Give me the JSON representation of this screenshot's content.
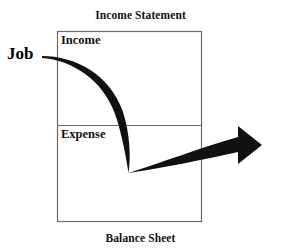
{
  "figure": {
    "type": "cashflow-diagram",
    "background_color": "#ffffff",
    "line_color": "#555555",
    "arrow_color": "#111111",
    "text_color": "#111111"
  },
  "titles": {
    "top": "Income Statement",
    "bottom": "Balance Sheet"
  },
  "statement_box": {
    "sections": [
      {
        "label": "Income"
      },
      {
        "label": "Expense"
      }
    ]
  },
  "annotations": {
    "source_label": "Job"
  },
  "flow": {
    "description": "Arrow from Job curving through Income down to Expense and out to the right",
    "start_label": "Job",
    "through": [
      "Income",
      "Expense"
    ],
    "direction": "right"
  }
}
